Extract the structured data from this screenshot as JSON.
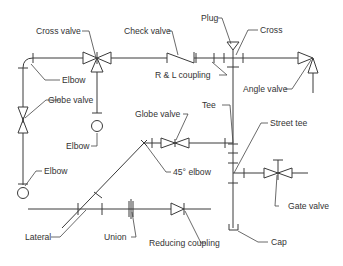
{
  "diagram": {
    "type": "piping-isometric-fittings",
    "labels": {
      "cross_valve": "Cross valve",
      "check_valve": "Check valve",
      "plug": "Plug",
      "cross": "Cross",
      "elbow_top": "Elbow",
      "rl_coupling": "R & L coupling",
      "angle_valve": "Angle valve",
      "globe_valve_left": "Globe valve",
      "elbow_mid": "Elbow",
      "globe_valve_mid": "Globe valve",
      "tee": "Tee",
      "street_tee": "Street tee",
      "elbow_bottom": "Elbow",
      "elbow_45": "45° elbow",
      "gate_valve": "Gate valve",
      "lateral": "Lateral",
      "union": "Union",
      "reducing_coupling": "Reducing coupling",
      "cap": "Cap"
    },
    "colors": {
      "line": "#3a3a3a",
      "text": "#333333",
      "background": "#ffffff"
    }
  }
}
